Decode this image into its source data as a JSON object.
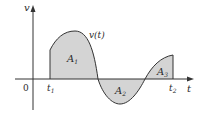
{
  "diagram": {
    "title": "",
    "axes": {
      "y_label": "v",
      "x_label": "t",
      "origin_label": "0"
    },
    "curve_label": "v(t)",
    "ticks": {
      "t1": "t",
      "t1_sub": "1",
      "t2": "t",
      "t2_sub": "2"
    },
    "regions": [
      {
        "name": "A1",
        "label": "A",
        "sub": "1",
        "sign": "positive"
      },
      {
        "name": "A2",
        "label": "A",
        "sub": "2",
        "sign": "negative"
      },
      {
        "name": "A3",
        "label": "A",
        "sub": "3",
        "sign": "positive"
      }
    ],
    "colors": {
      "fill": "#d4d4d4",
      "stroke": "#333333",
      "axis": "#333333"
    }
  }
}
